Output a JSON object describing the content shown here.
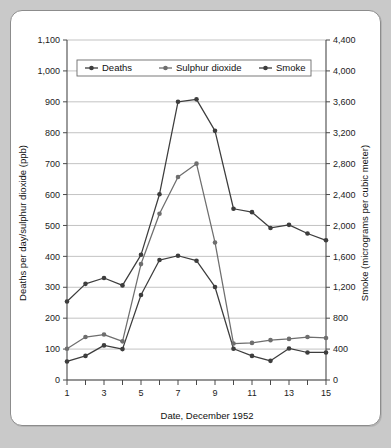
{
  "figure": {
    "background_color": "#c9c9c9",
    "card_color": "#ffffff",
    "border_color": "#8c8c8c"
  },
  "chart_data": {
    "type": "line",
    "title": "",
    "subtitle": "",
    "xlabel": "Date, December 1952",
    "ylabel": "Deaths per day/sulphur dioxide (ppb)",
    "y2label": "Smoke (micrograms per cubic meter)",
    "xlim": [
      1,
      15
    ],
    "ylim": [
      0,
      1100
    ],
    "y2lim": [
      0,
      4400
    ],
    "grid": true,
    "legend_position": "top-center",
    "x": [
      1,
      2,
      3,
      4,
      5,
      6,
      7,
      8,
      9,
      10,
      11,
      12,
      13,
      14,
      15
    ],
    "xtick_labels": [
      "1",
      "",
      "3",
      "",
      "5",
      "",
      "7",
      "",
      "9",
      "",
      "11",
      "",
      "13",
      "",
      "15"
    ],
    "xtick_labels_visible": [
      "1",
      "3",
      "5",
      "7",
      "9",
      "11",
      "13",
      "15"
    ],
    "ytick_labels": [
      "0",
      "100",
      "200",
      "300",
      "400",
      "500",
      "600",
      "700",
      "800",
      "900",
      "1,000",
      "1,100"
    ],
    "ytick_values": [
      0,
      100,
      200,
      300,
      400,
      500,
      600,
      700,
      800,
      900,
      1000,
      1100
    ],
    "y2tick_labels": [
      "0",
      "400",
      "800",
      "1,200",
      "1,600",
      "2,000",
      "2,400",
      "2,800",
      "3,200",
      "3,600",
      "4,000",
      "4,400"
    ],
    "y2tick_values": [
      0,
      400,
      800,
      1200,
      1600,
      2000,
      2400,
      2800,
      3200,
      3600,
      4000,
      4400
    ],
    "series": [
      {
        "name": "Deaths",
        "axis": "left",
        "units": "deaths per day",
        "color": "#3d3d3d",
        "marker": "circle",
        "values": [
          60,
          78,
          112,
          100,
          275,
          388,
          402,
          386,
          301,
          101,
          78,
          62,
          102,
          89,
          89
        ]
      },
      {
        "name": "Sulphur dioxide",
        "axis": "left",
        "units": "ppb",
        "color": "#6e6e6e",
        "marker": "circle",
        "values": [
          101,
          139,
          147,
          125,
          375,
          538,
          657,
          700,
          445,
          118,
          120,
          129,
          133,
          139,
          136
        ]
      },
      {
        "name": "Smoke",
        "axis": "right",
        "units": "micrograms per cubic meter",
        "color": "#3d3d3d",
        "marker": "circle",
        "values_left_scale": [
          254,
          311,
          330,
          306,
          405,
          601,
          900,
          908,
          806,
          554,
          543,
          492,
          502,
          474,
          452
        ],
        "values": [
          1016,
          1244,
          1320,
          1224,
          1620,
          2404,
          3600,
          3632,
          3224,
          2216,
          2172,
          1968,
          2008,
          1896,
          1808
        ]
      }
    ],
    "legend_entries": [
      "Deaths",
      "Sulphur dioxide",
      "Smoke"
    ]
  }
}
